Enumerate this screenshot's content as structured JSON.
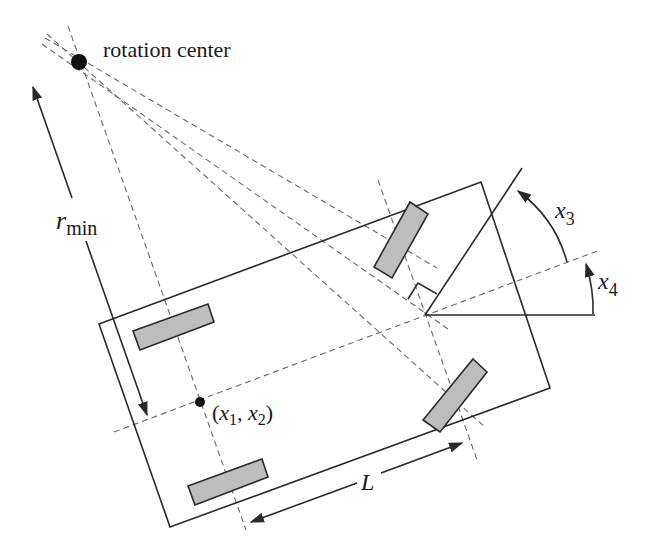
{
  "diagram": {
    "colors": {
      "line": "#2a2a2a",
      "dashed": "#6a6a6a",
      "wheel_fill": "#bdbdbd",
      "dot": "#111111",
      "background": "#ffffff"
    },
    "labels": {
      "rotation_center": "rotation center",
      "r_min_main": "r",
      "r_min_sub": "min",
      "position_open": "(",
      "position_x1": "x",
      "position_x1_sub": "1",
      "position_comma": ", ",
      "position_x2": "x",
      "position_x2_sub": "2",
      "position_close": ")",
      "wheelbase": "L",
      "steering_angle_main": "x",
      "steering_angle_sub": "3",
      "heading_angle_main": "x",
      "heading_angle_sub": "4"
    },
    "elements": {
      "rotation_center_point": {
        "x": 79,
        "y": 62
      },
      "reference_point": {
        "x": 200,
        "y": 402
      },
      "steering_pivot": {
        "x": 425,
        "y": 315
      },
      "body_corners": [
        [
          99,
          324
        ],
        [
          481,
          182
        ],
        [
          550,
          388
        ],
        [
          170,
          527
        ]
      ],
      "wheels": [
        "rear-left",
        "rear-right",
        "front-left",
        "front-right"
      ]
    }
  }
}
